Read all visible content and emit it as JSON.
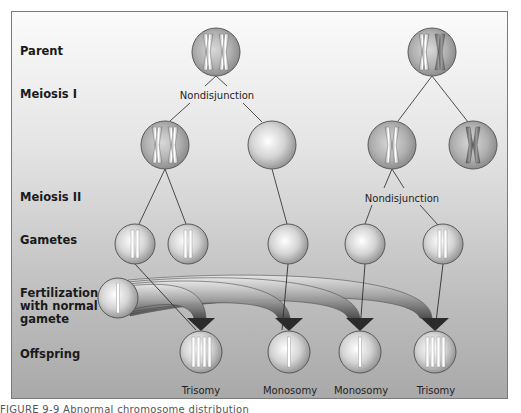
{
  "figure": {
    "caption": "FIGURE 9-9 Abnormal chromosome distribution"
  },
  "row_labels": {
    "parent": "Parent",
    "meiosis_1": "Meiosis I",
    "meiosis_2": "Meiosis II",
    "gametes": "Gametes",
    "fertilization_line1": "Fertilization",
    "fertilization_line2": "with normal",
    "fertilization_line3": "gamete",
    "offspring": "Offspring"
  },
  "annotations": {
    "left_nondisjunction": "Nondisjunction",
    "right_nondisjunction": "Nondisjunction"
  },
  "outcomes": [
    {
      "label": "Trisomy"
    },
    {
      "label": "Monosomy"
    },
    {
      "label": "Monosomy"
    },
    {
      "label": "Trisomy"
    }
  ],
  "colors": {
    "cell_edge": "#5a5a5a",
    "cell_center": "#ffffff",
    "cell_shade": "#9a9a9a",
    "chromosome_light": "#f4f4f4",
    "chromosome_dark": "#6e6e6e",
    "arrow_dark": "#2b2b2b",
    "line": "#3a3a3a"
  }
}
